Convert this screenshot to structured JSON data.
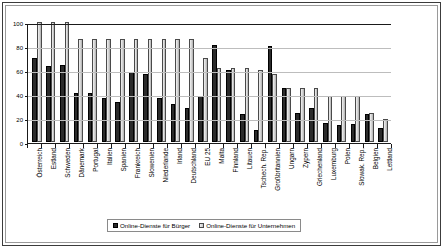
{
  "chart_data": {
    "type": "bar",
    "title": "",
    "xlabel": "",
    "ylabel": "",
    "ylim": [
      0,
      100
    ],
    "yticks": [
      0,
      20,
      40,
      60,
      80,
      100
    ],
    "grid": true,
    "legend_position": "bottom",
    "categories": [
      "Österreich",
      "Estland",
      "Schweden",
      "Dänemark",
      "Portugal",
      "Italien",
      "Spanien",
      "Frankreich",
      "Slowenien",
      "Niederlande",
      "Irland",
      "Deutschland",
      "EU 25",
      "Malta",
      "Finnland",
      "Litauen",
      "Tschech. Rep.",
      "Großbritannien",
      "Ungarn",
      "Zypern",
      "Griechenland",
      "Luxemburg",
      "Polen",
      "Slowak. Rep.",
      "Belgien",
      "Lettland"
    ],
    "series": [
      {
        "name": "Online-Dienste für Bürger",
        "color": "#2b2b2b",
        "values": [
          70,
          63,
          64,
          41,
          41,
          37,
          33,
          58,
          57,
          37,
          32,
          28,
          38,
          81,
          60,
          23,
          10,
          80,
          45,
          24,
          28,
          16,
          14,
          15,
          23,
          12
        ]
      },
      {
        "name": "Online-Dienste für Unternehmen",
        "color": "#d0d0d0",
        "values": [
          100,
          100,
          100,
          86,
          86,
          86,
          86,
          86,
          86,
          86,
          86,
          86,
          70,
          62,
          62,
          62,
          60,
          57,
          45,
          45,
          45,
          38,
          38,
          38,
          24,
          19
        ]
      }
    ]
  }
}
